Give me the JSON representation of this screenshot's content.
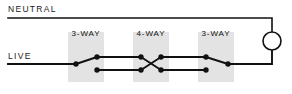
{
  "diagram": {
    "type": "electrical-schematic",
    "canvas": {
      "width": 292,
      "height": 94,
      "background": "#ffffff"
    },
    "colors": {
      "wire": "#111111",
      "node": "#111111",
      "label": "#1a1a1a",
      "switch_box_fill": "#e3e3e3",
      "lamp_stroke": "#111111",
      "lamp_fill": "#ffffff"
    },
    "rails": [
      {
        "name": "neutral",
        "label": "NEUTRAL",
        "label_x": 8,
        "label_y": 5,
        "wire_y": 18,
        "wire_x1": 8,
        "wire_x2": 272
      },
      {
        "name": "live",
        "label": "LIVE",
        "label_x": 8,
        "label_y": 52,
        "wire_y": 64,
        "wire_x1": 8,
        "wire_x2": 72
      }
    ],
    "switches": [
      {
        "id": "switch-3way-left",
        "label": "3-WAY",
        "kind": "3-way",
        "box": {
          "x": 68,
          "y": 32,
          "width": 36,
          "height": 50
        },
        "label_center_x": 86,
        "nodes": [
          {
            "name": "common",
            "x": 76,
            "y": 64
          },
          {
            "name": "traveler-upper",
            "x": 97,
            "y": 57
          },
          {
            "name": "traveler-lower",
            "x": 97,
            "y": 70
          }
        ],
        "blade": {
          "from": "common",
          "to": "traveler-upper"
        }
      },
      {
        "id": "switch-4way-middle",
        "label": "4-WAY",
        "kind": "4-way",
        "box": {
          "x": 133,
          "y": 32,
          "width": 36,
          "height": 50
        },
        "label_center_x": 151,
        "nodes": [
          {
            "name": "left-upper",
            "x": 141,
            "y": 57
          },
          {
            "name": "left-lower",
            "x": 141,
            "y": 70
          },
          {
            "name": "right-upper",
            "x": 161,
            "y": 57
          },
          {
            "name": "right-lower",
            "x": 161,
            "y": 70
          }
        ],
        "blades": [
          {
            "from": "left-upper",
            "to": "right-lower"
          },
          {
            "from": "left-lower",
            "to": "right-upper"
          }
        ]
      },
      {
        "id": "switch-3way-right",
        "label": "3-WAY",
        "kind": "3-way",
        "box": {
          "x": 198,
          "y": 32,
          "width": 36,
          "height": 50
        },
        "label_center_x": 216,
        "nodes": [
          {
            "name": "traveler-upper",
            "x": 206,
            "y": 57
          },
          {
            "name": "traveler-lower",
            "x": 206,
            "y": 70
          },
          {
            "name": "common",
            "x": 228,
            "y": 64
          }
        ],
        "blade": {
          "from": "traveler-upper",
          "to": "common"
        }
      }
    ],
    "lamp": {
      "id": "lamp",
      "name": "lamp",
      "cx": 272,
      "cy": 41,
      "r": 9,
      "lead_top_y": 18,
      "lead_bottom_y": 64
    },
    "travelers": [
      {
        "name": "upper-traveler-left",
        "x1": 97,
        "y1": 57,
        "x2": 141,
        "y2": 57
      },
      {
        "name": "lower-traveler-left",
        "x1": 97,
        "y1": 70,
        "x2": 141,
        "y2": 70
      },
      {
        "name": "upper-traveler-right",
        "x1": 161,
        "y1": 57,
        "x2": 206,
        "y2": 57
      },
      {
        "name": "lower-traveler-right",
        "x1": 161,
        "y1": 70,
        "x2": 206,
        "y2": 70
      },
      {
        "name": "lamp-return",
        "x1": 228,
        "y1": 64,
        "x2": 272,
        "y2": 64
      }
    ]
  }
}
